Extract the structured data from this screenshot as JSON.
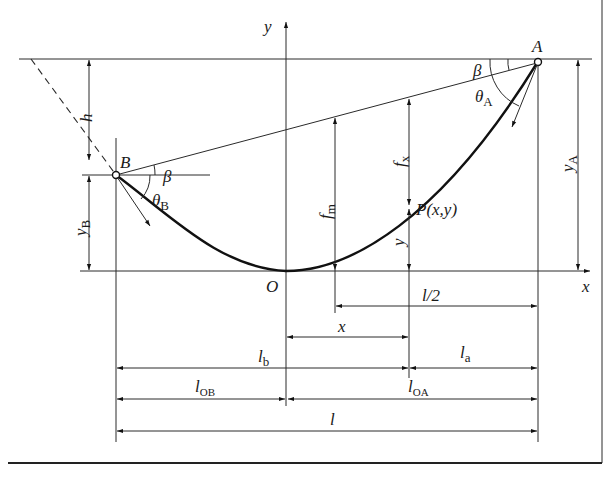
{
  "figure": {
    "axes": {
      "x_label": "x",
      "y_label": "y",
      "origin_label": "O"
    },
    "points": {
      "A": "A",
      "B": "B",
      "P": "P(x,y)"
    },
    "angles": {
      "beta_A": "β",
      "beta_B": "β",
      "theta_A": {
        "base": "θ",
        "sub": "A"
      },
      "theta_B": {
        "base": "θ",
        "sub": "B"
      }
    },
    "vertical_dimensions": {
      "h": "h",
      "y_B": {
        "base": "y",
        "sub": "B"
      },
      "y_A": {
        "base": "y",
        "sub": "A"
      },
      "f_m": {
        "base": "f",
        "sub": "m"
      },
      "f_x": {
        "base": "f",
        "sub": "x"
      },
      "y": "y"
    },
    "horizontal_dimensions": {
      "l_half": "l/2",
      "x": "x",
      "l_b": {
        "base": "l",
        "sub": "b"
      },
      "l_a": {
        "base": "l",
        "sub": "a"
      },
      "l_OB": {
        "base": "l",
        "sub": "OB"
      },
      "l_OA": {
        "base": "l",
        "sub": "OA"
      },
      "l": "l"
    }
  }
}
